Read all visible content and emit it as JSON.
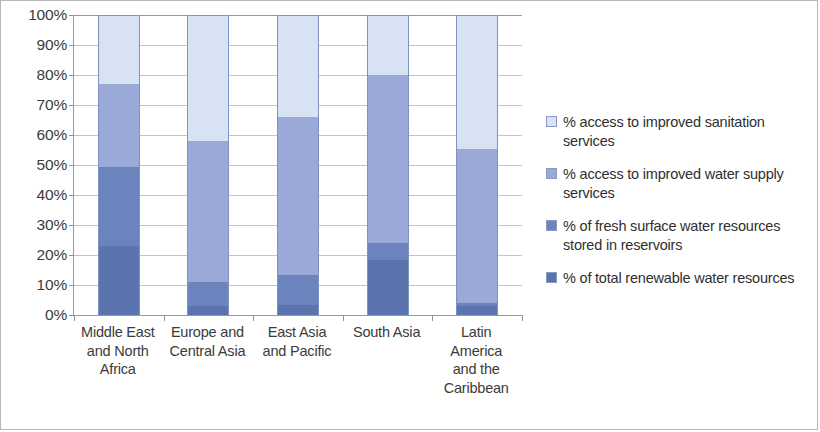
{
  "chart_data": {
    "type": "bar",
    "stacked": true,
    "title": "",
    "xlabel": "",
    "ylabel": "",
    "ylim": [
      0,
      100
    ],
    "grid": true,
    "legend_position": "right",
    "categories": [
      "Middle East and North Africa",
      "Europe and Central Asia",
      "East Asia and Pacific",
      "South Asia",
      "Latin America and the Caribbean"
    ],
    "category_lines": [
      [
        "Middle East",
        "and North",
        "Africa"
      ],
      [
        "Europe and",
        "Central Asia"
      ],
      [
        "East Asia",
        "and Pacific"
      ],
      [
        "South Asia"
      ],
      [
        "Latin",
        "America",
        "and the",
        "Caribbean"
      ]
    ],
    "ytick_labels": [
      "0%",
      "10%",
      "20%",
      "30%",
      "40%",
      "50%",
      "60%",
      "70%",
      "80%",
      "90%",
      "100%"
    ],
    "ytick_values": [
      0,
      10,
      20,
      30,
      40,
      50,
      60,
      70,
      80,
      90,
      100
    ],
    "series": [
      {
        "name": "% of total renewable water resources",
        "color": "#5b74ad",
        "values": [
          23,
          3,
          3.5,
          18.5,
          3
        ]
      },
      {
        "name": "% of fresh surface water resources stored in reservoirs",
        "color": "#6c84bd",
        "values": [
          26.5,
          8,
          10,
          5.5,
          1
        ]
      },
      {
        "name": "% access to improved water supply services",
        "color": "#9aa9d8",
        "values": [
          27.5,
          47,
          52.5,
          56,
          51.5
        ]
      },
      {
        "name": "% access to improved sanitation services",
        "color": "#d7e2f2",
        "values": [
          23,
          42,
          34,
          20,
          44.5
        ]
      }
    ],
    "cumulative_tops": [
      [
        23,
        49.5,
        77,
        100
      ],
      [
        3,
        11,
        58,
        100
      ],
      [
        3.5,
        13.5,
        66,
        100
      ],
      [
        18.5,
        24,
        80,
        100
      ],
      [
        3,
        4,
        55.5,
        100
      ]
    ]
  },
  "legend": {
    "entries": [
      {
        "label": "% access to improved sanitation services",
        "color": "#d7e2f2"
      },
      {
        "label": "% access to improved water supply services",
        "color": "#9aa9d8"
      },
      {
        "label": "% of fresh surface water resources stored in reservoirs",
        "color": "#6c84bd"
      },
      {
        "label": "% of total renewable water resources",
        "color": "#5b74ad"
      }
    ]
  },
  "colors": {
    "axis": "#9a9a9a",
    "gridline": "#c4c4c4",
    "frame_border": "#b8b8b8",
    "text": "#3b3b3b",
    "segment_outline": "#7f91c0"
  }
}
